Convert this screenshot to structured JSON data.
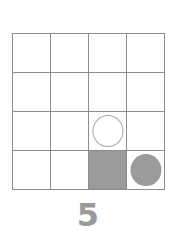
{
  "figure": {
    "label": "four-by-four-grid-puzzle",
    "background_color": "#ffffff",
    "grid": {
      "rows": 4,
      "columns": 4,
      "line_color": "#8c8c8c",
      "cell_background": "#ffffff",
      "cells": [
        {
          "row": 1,
          "col": 1,
          "content": "empty",
          "name": "cell-r1c1"
        },
        {
          "row": 1,
          "col": 2,
          "content": "empty",
          "name": "cell-r1c2"
        },
        {
          "row": 1,
          "col": 3,
          "content": "empty",
          "name": "cell-r1c3"
        },
        {
          "row": 1,
          "col": 4,
          "content": "empty",
          "name": "cell-r1c4"
        },
        {
          "row": 2,
          "col": 1,
          "content": "empty",
          "name": "cell-r2c1"
        },
        {
          "row": 2,
          "col": 2,
          "content": "empty",
          "name": "cell-r2c2"
        },
        {
          "row": 2,
          "col": 3,
          "content": "empty",
          "name": "cell-r2c3"
        },
        {
          "row": 2,
          "col": 4,
          "content": "empty",
          "name": "cell-r2c4"
        },
        {
          "row": 3,
          "col": 1,
          "content": "empty",
          "name": "cell-r3c1"
        },
        {
          "row": 3,
          "col": 2,
          "content": "empty",
          "name": "cell-r3c2"
        },
        {
          "row": 3,
          "col": 3,
          "content": "white-circle",
          "name": "cell-r3c3"
        },
        {
          "row": 3,
          "col": 4,
          "content": "empty",
          "name": "cell-r3c4"
        },
        {
          "row": 4,
          "col": 1,
          "content": "empty",
          "name": "cell-r4c1"
        },
        {
          "row": 4,
          "col": 2,
          "content": "empty",
          "name": "cell-r4c2"
        },
        {
          "row": 4,
          "col": 3,
          "content": "gray-square",
          "name": "cell-r4c3"
        },
        {
          "row": 4,
          "col": 4,
          "content": "gray-circle",
          "name": "cell-r4c4"
        }
      ]
    },
    "shapes": {
      "white_circle_fill": "#ffffff",
      "white_circle_stroke": "#a8a8a8",
      "gray_fill": "#9b9b9b"
    },
    "caption": {
      "text": "5",
      "color": "#9a9a9a"
    }
  }
}
